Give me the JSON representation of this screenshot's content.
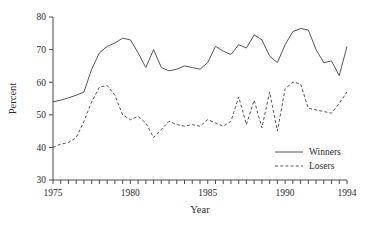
{
  "chart_data": {
    "type": "line",
    "title": "",
    "xlabel": "Year",
    "ylabel": "Percent",
    "xlim": [
      1975,
      1994
    ],
    "ylim": [
      30,
      80
    ],
    "grid": false,
    "legend_position": "bottom-right",
    "x_major_ticks": [
      1975,
      1980,
      1985,
      1990,
      1994
    ],
    "x_minor_tick_step": 1,
    "y_ticks": [
      30,
      40,
      50,
      60,
      70,
      80
    ],
    "x": [
      1975,
      1975.5,
      1976,
      1976.5,
      1977,
      1977.5,
      1978,
      1978.5,
      1979,
      1979.5,
      1980,
      1980.5,
      1981,
      1981.5,
      1982,
      1982.5,
      1983,
      1983.5,
      1984,
      1984.5,
      1985,
      1985.5,
      1986,
      1986.5,
      1987,
      1987.5,
      1988,
      1988.5,
      1989,
      1989.5,
      1990,
      1990.5,
      1991,
      1991.5,
      1992,
      1992.5,
      1993,
      1993.5,
      1994
    ],
    "series": [
      {
        "name": "Winners",
        "style": "solid",
        "color": "#555555",
        "values": [
          54.0,
          54.5,
          55.2,
          56.0,
          57.0,
          64.0,
          69.0,
          71.0,
          72.0,
          73.5,
          73.0,
          69.0,
          64.5,
          70.0,
          64.5,
          63.5,
          64.0,
          65.0,
          64.5,
          64.0,
          66.0,
          71.0,
          69.5,
          68.5,
          71.5,
          70.5,
          74.5,
          73.0,
          68.0,
          66.0,
          71.5,
          75.5,
          76.5,
          76.0,
          70.0,
          66.0,
          66.5,
          62.0,
          71.0
        ]
      },
      {
        "name": "Losers",
        "style": "dashed",
        "color": "#555555",
        "values": [
          40.0,
          41.0,
          41.5,
          43.0,
          48.0,
          54.0,
          58.5,
          59.0,
          56.0,
          50.0,
          48.5,
          49.5,
          47.5,
          43.0,
          45.5,
          48.0,
          47.0,
          46.5,
          47.0,
          46.5,
          48.5,
          47.5,
          46.5,
          48.0,
          55.5,
          47.0,
          54.5,
          46.0,
          57.0,
          45.0,
          58.0,
          60.0,
          59.5,
          52.0,
          51.5,
          51.0,
          50.5,
          53.5,
          57.0
        ]
      }
    ],
    "legend": [
      {
        "label": "Winners",
        "style": "solid"
      },
      {
        "label": "Losers",
        "style": "dashed"
      }
    ]
  }
}
